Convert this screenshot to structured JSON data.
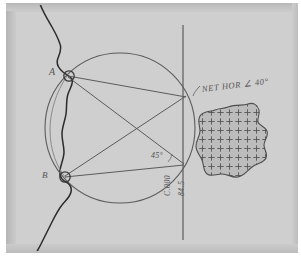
{
  "figure": {
    "kind": "hand-drawn survey diagram on gray paper",
    "background_color": "#cfcfcf",
    "ink_color": "#4a4a4a",
    "coast_color": "#2e2e2e"
  },
  "points": {
    "a_label": "A",
    "b_label": "B"
  },
  "annotations": {
    "angle_label": "45°",
    "net_hor_label": "NET HOR ∠ 40°",
    "vertical_label_1": "C.000",
    "vertical_label_2": "84.5"
  },
  "geometry": {
    "circle": {
      "cx": 120,
      "cy": 128,
      "r": 75
    },
    "station_a": {
      "x": 68,
      "y": 75
    },
    "station_b": {
      "x": 64,
      "y": 177
    },
    "target_upper": {
      "x": 183,
      "y": 97
    },
    "target_lower": {
      "x": 183,
      "y": 165
    },
    "vertical_line": {
      "x": 183,
      "y1": 25,
      "y2": 240
    },
    "chords": [
      {
        "from": "station_a",
        "to": "target_upper"
      },
      {
        "from": "station_a",
        "to": "target_lower"
      },
      {
        "from": "station_b",
        "to": "target_upper"
      },
      {
        "from": "station_b",
        "to": "target_lower"
      }
    ],
    "hatched_region": {
      "name": "cross-hatched island",
      "pattern": "plus-signs",
      "center": {
        "x": 233,
        "y": 140
      }
    },
    "coastline": {
      "name": "coastline trace",
      "orientation": "runs top to bottom through stations A and B"
    }
  }
}
